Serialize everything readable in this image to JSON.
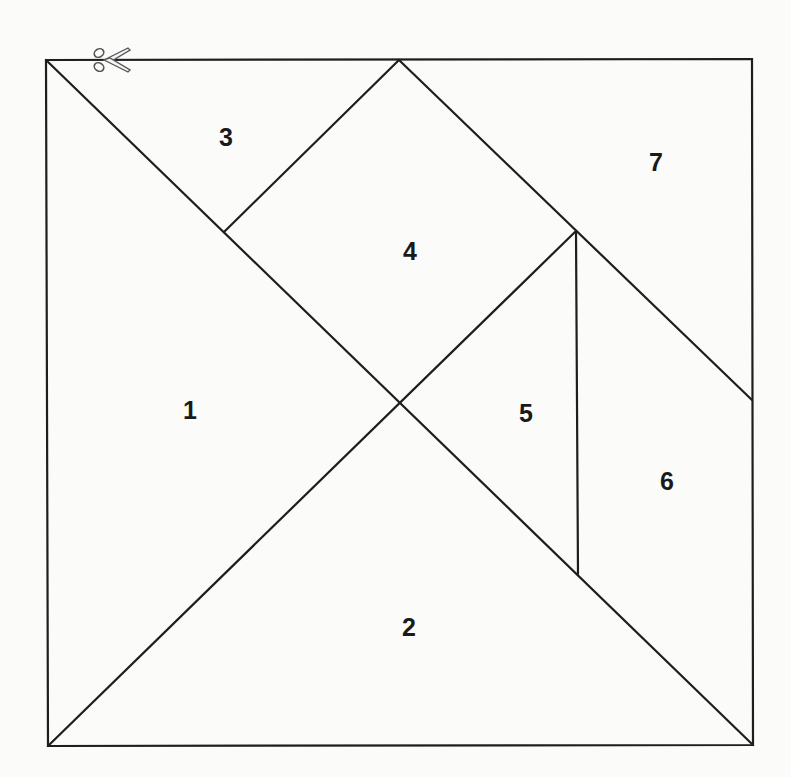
{
  "diagram": {
    "type": "tangram-cutout",
    "outer_square": {
      "top_left": [
        46,
        60
      ],
      "top_right": [
        752,
        59
      ],
      "bottom_right": [
        753,
        745
      ],
      "bottom_left": [
        48,
        746
      ]
    },
    "cut_icon": "scissors-icon",
    "pieces": [
      {
        "id": 1,
        "label": "1",
        "shape": "large-triangle",
        "label_pos": [
          190,
          410
        ]
      },
      {
        "id": 2,
        "label": "2",
        "shape": "large-triangle",
        "label_pos": [
          409,
          627
        ]
      },
      {
        "id": 3,
        "label": "3",
        "shape": "small-triangle",
        "label_pos": [
          226,
          137
        ]
      },
      {
        "id": 4,
        "label": "4",
        "shape": "square",
        "label_pos": [
          410,
          251
        ]
      },
      {
        "id": 5,
        "label": "5",
        "shape": "small-triangle",
        "label_pos": [
          526,
          413
        ]
      },
      {
        "id": 6,
        "label": "6",
        "shape": "parallelogram",
        "label_pos": [
          667,
          481
        ]
      },
      {
        "id": 7,
        "label": "7",
        "shape": "medium-triangle",
        "label_pos": [
          656,
          162
        ]
      }
    ],
    "colors": {
      "line": "#1e1e1e",
      "background": "#fbfbfa",
      "label": "#1a1a1a"
    }
  }
}
